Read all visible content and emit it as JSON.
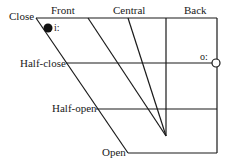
{
  "diagram": {
    "type": "vowel-quadrilateral",
    "columns": [
      "Front",
      "Central",
      "Back"
    ],
    "rows": [
      "Close",
      "Half-close",
      "Half-open",
      "Open"
    ],
    "symbols": [
      {
        "symbol": "i:",
        "position": "close-front",
        "marker": "filled-circle"
      },
      {
        "symbol": "o:",
        "position": "half-close-back",
        "marker": "open-circle"
      }
    ],
    "line_color": "#1a1a1a"
  }
}
